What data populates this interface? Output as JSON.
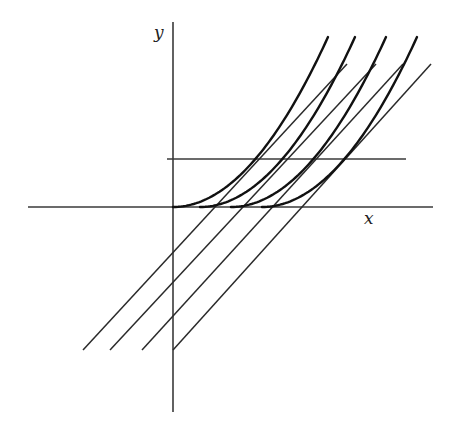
{
  "diagram": {
    "type": "function-graph",
    "axes": {
      "x_label": "x",
      "y_label": "y",
      "x_axis": {
        "x1": 28,
        "x2": 433,
        "y": 207
      },
      "y_axis": {
        "x": 173,
        "y1": 22,
        "y2": 412
      }
    },
    "horizontal_line": {
      "x1": 167,
      "x2": 406,
      "y": 159
    },
    "curves": [
      {
        "name": "curve-1",
        "x0": 173,
        "x_end": 328
      },
      {
        "name": "curve-2",
        "x0": 200,
        "x_end": 355
      },
      {
        "name": "curve-3",
        "x0": 231,
        "x_end": 386
      },
      {
        "name": "curve-4",
        "x0": 262,
        "x_end": 417
      }
    ],
    "curve_base_y": 207,
    "curve_top_y": 37,
    "tangent_lines": [
      {
        "name": "tangent-1",
        "x1": 83,
        "y1": 350,
        "x2": 347,
        "y2": 64
      },
      {
        "name": "tangent-2",
        "x1": 110,
        "y1": 350,
        "x2": 376,
        "y2": 64
      },
      {
        "name": "tangent-3",
        "x1": 142,
        "y1": 350,
        "x2": 403,
        "y2": 64
      },
      {
        "name": "tangent-4",
        "x1": 173,
        "y1": 350,
        "x2": 431,
        "y2": 64
      }
    ],
    "colors": {
      "curve": "#111111",
      "line": "#2a2a2a",
      "background": "#ffffff"
    }
  }
}
